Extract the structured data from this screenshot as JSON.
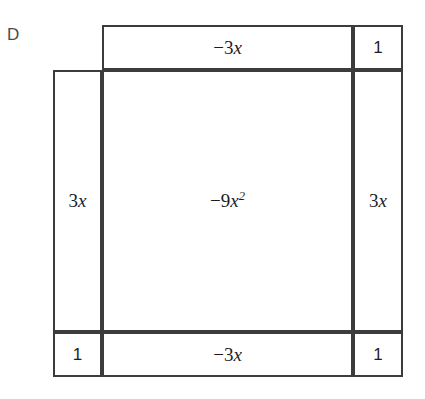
{
  "choice": {
    "letter": "D"
  },
  "figure": {
    "name": "algebra-tile-area-model",
    "line_color": "#3c3c3c",
    "background_color": "#ffffff",
    "cells": {
      "top_middle": {
        "text": "−3x",
        "coefficient": -3,
        "variable": "x",
        "power": 1
      },
      "top_right": {
        "text": "1",
        "coefficient": 1,
        "variable": "",
        "power": 0
      },
      "mid_left": {
        "text": "3x",
        "coefficient": 3,
        "variable": "x",
        "power": 1
      },
      "mid_center": {
        "text": "−9x²",
        "coefficient": -9,
        "variable": "x",
        "power": 2
      },
      "mid_right": {
        "text": "3x",
        "coefficient": 3,
        "variable": "x",
        "power": 1
      },
      "bot_left": {
        "text": "1",
        "coefficient": 1,
        "variable": "",
        "power": 0
      },
      "bot_middle": {
        "text": "−3x",
        "coefficient": -3,
        "variable": "x",
        "power": 1
      },
      "bot_right": {
        "text": "1",
        "coefficient": 1,
        "variable": "",
        "power": 0
      }
    }
  }
}
